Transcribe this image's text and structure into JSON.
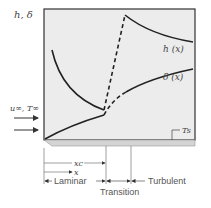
{
  "diagram": {
    "axis_label": "h, δ",
    "curve_labels": {
      "h": "h (x)",
      "delta": "δ (x)"
    },
    "freestream_label": "u∞, T∞",
    "surface_temp_label": "Ts",
    "dimension_labels": {
      "xc": "xc",
      "x": "x"
    },
    "regions": {
      "laminar": "Laminar",
      "transition": "Transition",
      "turbulent": "Turbulent"
    },
    "colors": {
      "panel_fill": "#ececec",
      "curve": "#222222",
      "plate": "#d8d8d8",
      "dim_lines": "#777777"
    }
  }
}
